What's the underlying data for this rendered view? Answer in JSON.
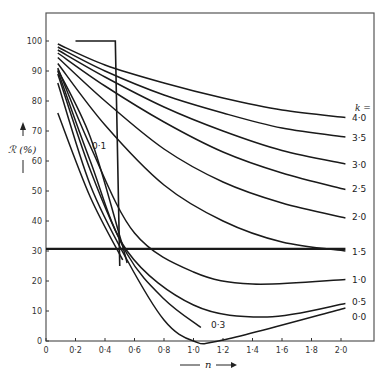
{
  "chart_data": {
    "type": "line",
    "title": "",
    "xlabel": "n",
    "ylabel": "R (%)",
    "xlim": [
      0,
      2.25
    ],
    "ylim": [
      0,
      110
    ],
    "grid": false,
    "x_ticks": [
      "0",
      "0.2",
      "0.4",
      "0.6",
      "0.8",
      "1.0",
      "1.2",
      "1.4",
      "1.6",
      "1.8",
      "2.0"
    ],
    "x_tick_values": [
      0,
      0.2,
      0.4,
      0.6,
      0.8,
      1.0,
      1.2,
      1.4,
      1.6,
      1.8,
      2.0
    ],
    "y_ticks": [
      "0",
      "10",
      "20",
      "30",
      "40",
      "50",
      "60",
      "70",
      "80",
      "90",
      "100"
    ],
    "y_tick_values": [
      0,
      10,
      20,
      30,
      40,
      50,
      60,
      70,
      80,
      90,
      100
    ],
    "legend_title": "k =",
    "series": [
      {
        "name": "4.0",
        "label": "4·0",
        "points": [
          [
            0.08,
            99
          ],
          [
            0.4,
            92
          ],
          [
            0.8,
            86
          ],
          [
            1.2,
            81
          ],
          [
            1.6,
            77
          ],
          [
            2.03,
            74.5
          ]
        ]
      },
      {
        "name": "3.5",
        "label": "3·5",
        "points": [
          [
            0.08,
            98
          ],
          [
            0.4,
            90
          ],
          [
            0.8,
            82
          ],
          [
            1.2,
            76
          ],
          [
            1.6,
            71
          ],
          [
            2.03,
            68
          ]
        ]
      },
      {
        "name": "3.0",
        "label": "3·0",
        "points": [
          [
            0.08,
            97
          ],
          [
            0.4,
            88
          ],
          [
            0.8,
            78
          ],
          [
            1.2,
            70
          ],
          [
            1.6,
            63.5
          ],
          [
            2.03,
            59
          ]
        ]
      },
      {
        "name": "2.5",
        "label": "2·5",
        "points": [
          [
            0.08,
            96
          ],
          [
            0.4,
            85
          ],
          [
            0.8,
            73
          ],
          [
            1.2,
            63
          ],
          [
            1.6,
            56
          ],
          [
            2.03,
            50.5
          ]
        ]
      },
      {
        "name": "2.0",
        "label": "2·0",
        "points": [
          [
            0.08,
            94.5
          ],
          [
            0.4,
            80
          ],
          [
            0.8,
            64
          ],
          [
            1.2,
            53
          ],
          [
            1.6,
            46
          ],
          [
            2.03,
            41
          ]
        ]
      },
      {
        "name": "1.5",
        "label": "1·5",
        "points": [
          [
            0.08,
            92.5
          ],
          [
            0.4,
            72
          ],
          [
            0.8,
            52
          ],
          [
            1.2,
            40
          ],
          [
            1.6,
            33
          ],
          [
            2.03,
            30
          ]
        ]
      },
      {
        "name": "1.0",
        "label": "1·0",
        "points": [
          [
            0.08,
            91
          ],
          [
            0.3,
            65
          ],
          [
            0.6,
            36
          ],
          [
            1.0,
            23
          ],
          [
            1.4,
            19
          ],
          [
            2.03,
            20.5
          ]
        ]
      },
      {
        "name": "0.5",
        "label": "0·5",
        "points": [
          [
            0.08,
            90
          ],
          [
            0.3,
            60
          ],
          [
            0.55,
            30
          ],
          [
            1.0,
            12
          ],
          [
            1.5,
            8
          ],
          [
            2.03,
            12.5
          ]
        ]
      },
      {
        "name": "0.3",
        "label": "0·3",
        "points": [
          [
            0.08,
            89
          ],
          [
            0.3,
            57
          ],
          [
            0.55,
            29
          ],
          [
            0.8,
            14
          ],
          [
            1.05,
            4.5
          ]
        ]
      },
      {
        "name": "0.1",
        "label": "0·1",
        "points": [
          [
            0.08,
            90.5
          ],
          [
            0.3,
            68
          ],
          [
            0.5,
            35
          ],
          [
            0.55,
            26
          ]
        ]
      },
      {
        "name": "0.0",
        "label": "0·0",
        "points": [
          [
            0.08,
            86
          ],
          [
            0.3,
            52
          ],
          [
            0.55,
            27
          ],
          [
            0.8,
            7
          ],
          [
            1.0,
            0
          ],
          [
            1.2,
            0.3
          ],
          [
            2.03,
            11
          ]
        ]
      },
      {
        "name": "unlabeled",
        "label": "",
        "points": [
          [
            0.08,
            76
          ],
          [
            0.3,
            48
          ],
          [
            0.52,
            27
          ]
        ]
      }
    ],
    "annotations": [
      {
        "type": "step",
        "label": "",
        "points": [
          [
            0.2,
            100
          ],
          [
            0.47,
            100
          ],
          [
            0.5,
            25
          ]
        ]
      },
      {
        "type": "hline",
        "label": "",
        "y": 30.7,
        "x_range": [
          0,
          2.03
        ]
      }
    ]
  },
  "labels": {
    "y_axis_title": "ℛ (%)",
    "x_axis_title": "n",
    "k_header": "k =",
    "curve_labels": {
      "k40": "4·0",
      "k35": "3·5",
      "k30": "3·0",
      "k25": "2·5",
      "k20": "2·0",
      "k15": "1·5",
      "k10": "1·0",
      "k05": "0·5",
      "k00": "0·0",
      "k03": "0·3",
      "k01": "0·1"
    },
    "x_ticks": [
      "0",
      "0·2",
      "0·4",
      "0·6",
      "0·8",
      "1·0",
      "1·2",
      "1·4",
      "1·6",
      "1·8",
      "2·0"
    ],
    "y_ticks": [
      "0",
      "10",
      "20",
      "30",
      "40",
      "50",
      "60",
      "70",
      "80",
      "90",
      "100"
    ]
  }
}
